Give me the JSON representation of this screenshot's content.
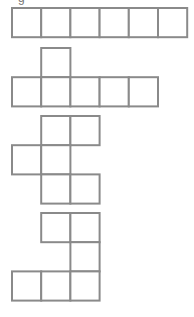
{
  "figure": {
    "partial_label": "g",
    "stroke_color": "#8a8a8a",
    "fill_color": "#ffffff",
    "cell_size": 29.2,
    "origin_x": 12,
    "nets": [
      {
        "name": "net-1-row-of-six",
        "top": 8,
        "cells": [
          [
            0,
            0
          ],
          [
            0,
            1
          ],
          [
            0,
            2
          ],
          [
            0,
            3
          ],
          [
            0,
            4
          ],
          [
            0,
            5
          ]
        ]
      },
      {
        "name": "net-2-row-of-five-with-tab",
        "top": 48,
        "cells": [
          [
            0,
            1
          ],
          [
            1,
            0
          ],
          [
            1,
            1
          ],
          [
            1,
            2
          ],
          [
            1,
            3
          ],
          [
            1,
            4
          ]
        ]
      },
      {
        "name": "net-3-zigzag",
        "top": 116,
        "cells": [
          [
            0,
            1
          ],
          [
            0,
            2
          ],
          [
            1,
            0
          ],
          [
            1,
            1
          ],
          [
            2,
            1
          ],
          [
            2,
            2
          ]
        ]
      },
      {
        "name": "net-4-hook",
        "top": 213,
        "cells": [
          [
            0,
            1
          ],
          [
            0,
            2
          ],
          [
            1,
            2
          ],
          [
            2,
            0
          ],
          [
            2,
            1
          ],
          [
            2,
            2
          ]
        ]
      }
    ]
  }
}
